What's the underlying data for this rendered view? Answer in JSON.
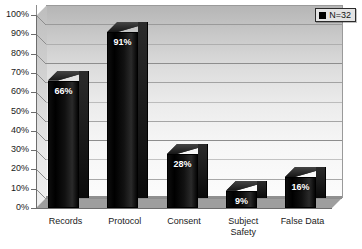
{
  "chart_data": {
    "type": "bar",
    "title": "",
    "xlabel": "",
    "ylabel": "",
    "ylim": [
      0,
      100
    ],
    "grid": true,
    "legend_position": "top-right",
    "style": "3d-column",
    "categories": [
      "Records",
      "Protocol",
      "Consent",
      "Subject Safety",
      "False Data"
    ],
    "values": [
      66,
      91,
      28,
      9,
      16
    ],
    "data_labels": [
      "66%",
      "91%",
      "28%",
      "9%",
      "16%"
    ],
    "ytick_labels": [
      "100%",
      "90%",
      "80%",
      "70%",
      "60%",
      "50%",
      "40%",
      "30%",
      "20%",
      "10%",
      "0%"
    ],
    "ytick_values": [
      100,
      90,
      80,
      70,
      60,
      50,
      40,
      30,
      20,
      10,
      0
    ],
    "series": [
      {
        "name": "N=32",
        "values": [
          66,
          91,
          28,
          9,
          16
        ],
        "color": "#000000"
      }
    ],
    "legend": [
      {
        "label": "N=32",
        "color": "#000000"
      }
    ]
  },
  "category_lines": [
    [
      "Records"
    ],
    [
      "Protocol"
    ],
    [
      "Consent"
    ],
    [
      "Subject",
      "Safety"
    ],
    [
      "False Data"
    ]
  ],
  "colors": {
    "bar": "#000000",
    "axis": "#6d6d6d",
    "gridline": "#8d8d8d",
    "wall_top": "#b5b5b5",
    "wall_bottom": "#fcfcfc",
    "floor": "#9e9e9e",
    "label_text": "#1a1a1a",
    "data_label_text": "#ffffff",
    "legend_bg": "#e3e3e3"
  }
}
